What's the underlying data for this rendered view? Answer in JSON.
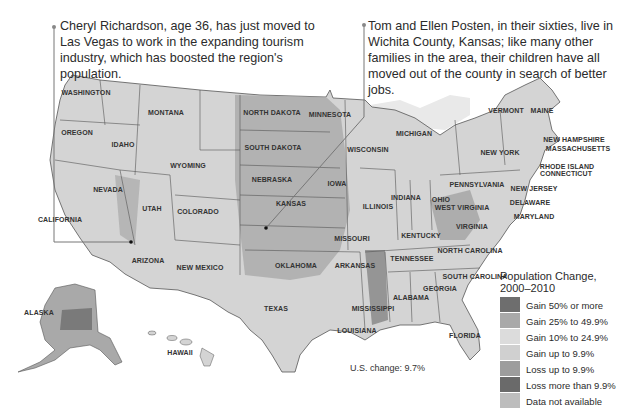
{
  "callouts": {
    "left": "Cheryl Richardson, age 36, has just moved to Las Vegas to work in the expanding tourism industry, which has boosted the region's population.",
    "right": "Tom and Ellen Posten, in their sixties, live in Wichita County, Kansas; like many other families in the area, their children have all moved out of the county in search of better jobs."
  },
  "states": [
    {
      "name": "WASHINGTON",
      "x": 86,
      "y": 93
    },
    {
      "name": "OREGON",
      "x": 77,
      "y": 133
    },
    {
      "name": "IDAHO",
      "x": 123,
      "y": 145
    },
    {
      "name": "MONTANA",
      "x": 166,
      "y": 113
    },
    {
      "name": "WYOMING",
      "x": 188,
      "y": 166
    },
    {
      "name": "NEVADA",
      "x": 108,
      "y": 190
    },
    {
      "name": "CALIFORNIA",
      "x": 60,
      "y": 220
    },
    {
      "name": "UTAH",
      "x": 152,
      "y": 209
    },
    {
      "name": "COLORADO",
      "x": 198,
      "y": 212
    },
    {
      "name": "ARIZONA",
      "x": 148,
      "y": 261
    },
    {
      "name": "NEW MEXICO",
      "x": 200,
      "y": 268
    },
    {
      "name": "NORTH DAKOTA",
      "x": 272,
      "y": 113
    },
    {
      "name": "SOUTH DAKOTA",
      "x": 273,
      "y": 148
    },
    {
      "name": "NEBRASKA",
      "x": 272,
      "y": 180
    },
    {
      "name": "KANSAS",
      "x": 291,
      "y": 204
    },
    {
      "name": "OKLAHOMA",
      "x": 296,
      "y": 266
    },
    {
      "name": "TEXAS",
      "x": 276,
      "y": 309
    },
    {
      "name": "MINNESOTA",
      "x": 330,
      "y": 115
    },
    {
      "name": "IOWA",
      "x": 337,
      "y": 184
    },
    {
      "name": "MISSOURI",
      "x": 352,
      "y": 239
    },
    {
      "name": "ARKANSAS",
      "x": 355,
      "y": 266
    },
    {
      "name": "LOUISIANA",
      "x": 357,
      "y": 331
    },
    {
      "name": "WISCONSIN",
      "x": 368,
      "y": 150
    },
    {
      "name": "ILLINOIS",
      "x": 378,
      "y": 207
    },
    {
      "name": "MICHIGAN",
      "x": 414,
      "y": 134
    },
    {
      "name": "INDIANA",
      "x": 406,
      "y": 198
    },
    {
      "name": "OHIO",
      "x": 441,
      "y": 200
    },
    {
      "name": "KENTUCKY",
      "x": 421,
      "y": 236
    },
    {
      "name": "TENNESSEE",
      "x": 412,
      "y": 259
    },
    {
      "name": "MISSISSIPPI",
      "x": 373,
      "y": 309
    },
    {
      "name": "ALABAMA",
      "x": 411,
      "y": 298
    },
    {
      "name": "GEORGIA",
      "x": 440,
      "y": 289
    },
    {
      "name": "FLORIDA",
      "x": 465,
      "y": 336
    },
    {
      "name": "SOUTH CAROLINA",
      "x": 475,
      "y": 277
    },
    {
      "name": "NORTH CAROLINA",
      "x": 470,
      "y": 251
    },
    {
      "name": "VIRGINIA",
      "x": 472,
      "y": 227
    },
    {
      "name": "WEST VIRGINIA",
      "x": 462,
      "y": 208
    },
    {
      "name": "PENNSYLVANIA",
      "x": 477,
      "y": 185
    },
    {
      "name": "NEW YORK",
      "x": 500,
      "y": 153
    },
    {
      "name": "VERMONT",
      "x": 506,
      "y": 111
    },
    {
      "name": "MAINE",
      "x": 542,
      "y": 111
    },
    {
      "name": "NEW HAMPSHIRE",
      "x": 574,
      "y": 140
    },
    {
      "name": "MASSACHUSETTS",
      "x": 578,
      "y": 149
    },
    {
      "name": "RHODE ISLAND",
      "x": 567,
      "y": 167
    },
    {
      "name": "CONNECTICUT",
      "x": 566,
      "y": 174
    },
    {
      "name": "NEW JERSEY",
      "x": 534,
      "y": 189
    },
    {
      "name": "DELAWARE",
      "x": 530,
      "y": 203
    },
    {
      "name": "MARYLAND",
      "x": 534,
      "y": 217
    },
    {
      "name": "ALASKA",
      "x": 39,
      "y": 313
    },
    {
      "name": "HAWAII",
      "x": 180,
      "y": 353
    }
  ],
  "legend": {
    "title_line1": "Population Change,",
    "title_line2": "2000–2010",
    "items": [
      {
        "label": "Gain 50% or more",
        "color": "#6e6e6e"
      },
      {
        "label": "Gain 25% to 49.9%",
        "color": "#a9a9a9"
      },
      {
        "label": "Gain 10% to 24.9%",
        "color": "#dcdcdc"
      },
      {
        "label": "Gain up to 9.9%",
        "color": "#d0d0d0"
      },
      {
        "label": "Loss up to 9.9%",
        "color": "#9d9d9d"
      },
      {
        "label": "Loss more than 9.9%",
        "color": "#6a6a6a"
      },
      {
        "label": "Data not available",
        "color": "#bdbdbd"
      }
    ]
  },
  "us_change": "U.S. change: 9.7%"
}
